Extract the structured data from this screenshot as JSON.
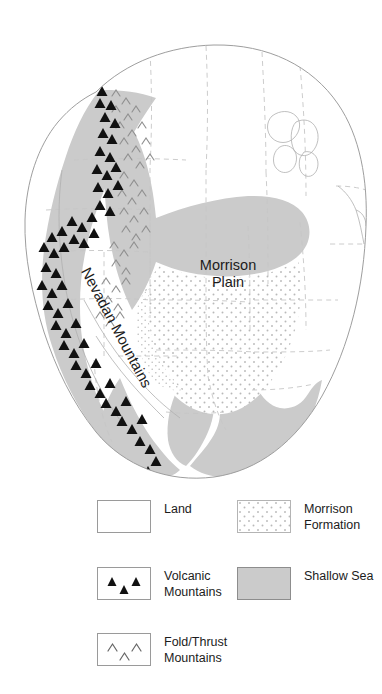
{
  "figure": {
    "kind": "paleogeographic-map",
    "region": "western North America",
    "map_labels": [
      {
        "id": "morrison-plain",
        "text": "Morrison\nPlain",
        "x": 228,
        "y": 270,
        "rotation": 0
      },
      {
        "id": "nevadan-mountains",
        "text": "Nevadan Mountains",
        "x": 112,
        "y": 330,
        "rotation": 62
      }
    ]
  },
  "legend": {
    "columns": [
      {
        "id": "legend-column-left",
        "entries": [
          {
            "id": "land",
            "label": "Land",
            "swatch": "land",
            "fill": "#ffffff"
          },
          {
            "id": "volcanic-mountains",
            "label": "Volcanic\nMountains",
            "swatch": "volcanic",
            "fill": "#ffffff"
          },
          {
            "id": "fold-thrust-mountains",
            "label": "Fold/Thrust\nMountains",
            "swatch": "foldthrust",
            "fill": "#ffffff"
          }
        ]
      },
      {
        "id": "legend-column-right",
        "entries": [
          {
            "id": "morrison-formation",
            "label": "Morrison\nFormation",
            "swatch": "morrison",
            "fill": "#ffffff"
          },
          {
            "id": "shallow-sea",
            "label": "Shallow Sea",
            "swatch": "sea",
            "fill": "#cbcbcb"
          }
        ]
      }
    ]
  },
  "colors": {
    "land": "#ffffff",
    "shallow_sea": "#cbcbcb",
    "morrison_stipple_dot": "#b9b9b9",
    "coastline": "#9e9e9e",
    "state_border": "#c3c3c3",
    "volcano_symbol": "#111111",
    "fold_symbol": "#8f8f8f",
    "text": "#1c1c1c"
  },
  "symbols": {
    "volcanic": "filled-triangle",
    "fold_thrust": "chevron-caret",
    "morrison": "stipple-dots",
    "shallow_sea": "solid-gray-fill"
  }
}
